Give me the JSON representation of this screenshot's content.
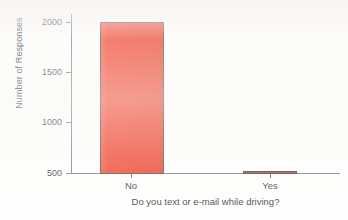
{
  "chart_data": {
    "type": "bar",
    "title": "",
    "subtitle": "",
    "xlabel": "Do you text or e-mail while driving?",
    "ylabel": "Number of Responses",
    "categories": [
      "No",
      "Yes"
    ],
    "values": [
      1985,
      520
    ],
    "ylim": [
      500,
      2060
    ],
    "yticks": [
      500,
      1000,
      1500,
      2000
    ],
    "ytick_labels": [
      "500",
      "1000",
      "1500",
      "2000"
    ],
    "grid": false,
    "legend": null,
    "series": [
      {
        "name": "Number of Responses",
        "values": [
          1985,
          520
        ]
      }
    ],
    "bar_colors": [
      "#ee2b11",
      "#8d3321"
    ],
    "bar_edge_color": "#4a3430",
    "axis_color": "#6d6d6d",
    "background_color": "#fdfdfc"
  },
  "axes": {
    "y_title": "Number of Responses",
    "x_title": "Do you text or e-mail while driving?",
    "y_ticks": [
      {
        "label": "2000"
      },
      {
        "label": "1500"
      },
      {
        "label": "1000"
      },
      {
        "label": "500"
      }
    ],
    "x_ticks": [
      {
        "label": "No"
      },
      {
        "label": "Yes"
      }
    ]
  }
}
